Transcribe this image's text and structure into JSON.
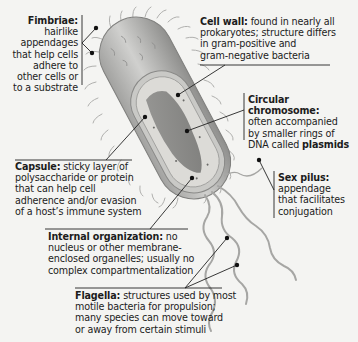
{
  "diagram": {
    "colors": {
      "background": "#f4f4f2",
      "cell_body": "#bdbdbb",
      "cell_shadow": "#8e8e8c",
      "cytoplasm": "#d9d8d4",
      "chromosome": "#7d7d7b",
      "leader_line": "#222222",
      "appendage": "#a9a9a7"
    },
    "labels": [
      {
        "id": "fimbriae",
        "term": "Fimbriae:",
        "lines": [
          "hairlike",
          "appendages",
          "that help cells",
          "adhere to",
          "other cells or",
          "to a substrate"
        ]
      },
      {
        "id": "cell_wall",
        "term": "Cell wall:",
        "lines": [
          "found in nearly all",
          "prokaryotes; structure differs",
          "in gram-positive and",
          "gram-negative bacteria"
        ]
      },
      {
        "id": "circular_chromosome",
        "term": "Circular chromosome:",
        "lines": [
          "often accompanied",
          "by smaller rings of",
          "DNA called"
        ],
        "emphasis": "plasmids"
      },
      {
        "id": "capsule",
        "term": "Capsule:",
        "lines": [
          "sticky layer of",
          "polysaccharide or protein",
          "that can help cell",
          "adherence and/or evasion",
          "of a host’s immune system"
        ]
      },
      {
        "id": "sex_pilus",
        "term": "Sex pilus:",
        "lines": [
          "appendage",
          "that facilitates",
          "conjugation"
        ]
      },
      {
        "id": "internal_organization",
        "term": "Internal organization:",
        "lines": [
          "no",
          "nucleus or other membrane-",
          "enclosed organelles; usually no",
          "complex compartmentalization"
        ]
      },
      {
        "id": "flagella",
        "term": "Flagella:",
        "lines": [
          "structures used by most",
          "motile bacteria for propulsion;",
          "many species can move toward",
          "or away from certain stimuli"
        ]
      }
    ]
  }
}
